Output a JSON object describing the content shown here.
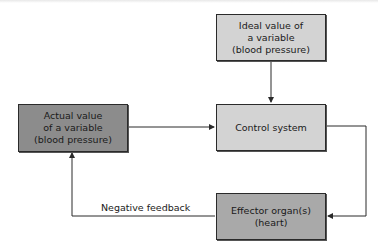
{
  "diagram": {
    "type": "flowchart",
    "nodes": [
      {
        "id": "ideal",
        "lines": [
          "Ideal value of",
          "a variable",
          "(blood pressure)"
        ],
        "fill": "#d3d3d3"
      },
      {
        "id": "actual",
        "lines": [
          "Actual value",
          "of a variable",
          "(blood pressure)"
        ],
        "fill": "#8c8c8c"
      },
      {
        "id": "control",
        "lines": [
          "Control system"
        ],
        "fill": "#d3d3d3"
      },
      {
        "id": "effector",
        "lines": [
          "Effector organ(s)",
          "(heart)"
        ],
        "fill": "#a9a9a9"
      }
    ],
    "edges": [
      {
        "from": "ideal",
        "to": "control",
        "label": ""
      },
      {
        "from": "actual",
        "to": "control",
        "label": ""
      },
      {
        "from": "control",
        "to": "effector",
        "label": ""
      },
      {
        "from": "effector",
        "to": "actual",
        "label": "Negative feedback"
      }
    ],
    "edge_label_negative_feedback": "Negative feedback",
    "line_color": "#2a2a2a"
  }
}
